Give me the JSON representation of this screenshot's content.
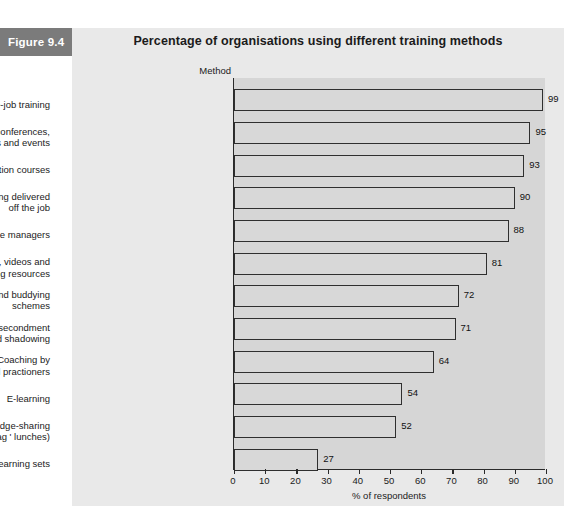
{
  "figure": {
    "label": "Figure 9.4"
  },
  "chart_data": {
    "type": "bar",
    "orientation": "horizontal",
    "title": "Percentage of organisations using different training methods",
    "xlabel": "% of respondents",
    "ylabel": "Method",
    "xlim": [
      0,
      100
    ],
    "xticks": [
      "0",
      "10",
      "20",
      "30",
      "40",
      "50",
      "60",
      "70",
      "80",
      "90",
      "100"
    ],
    "grid": false,
    "legend": null,
    "bar_fill_color": "#d8d8d8",
    "bar_edge_color": "#2f2f2f",
    "plot_bg_color": "#d6d6d6",
    "panel_bg_color": "#e9e9e9",
    "categories": [
      "On-the-job training",
      "External conferences,\nworkshops and events",
      "Formal education courses",
      "Instructor-led training delivered\noff the job",
      "Coaching by line managers",
      "Audio tapes, videos and\nlearning resources",
      "Mentoring and buddying\nschemes",
      "Job rotation, secondment\nand shadowing",
      "Coaching by\nexternal practioners",
      "E-learning",
      "Internal knowledge-sharing\nevents (brown bag ' lunches)",
      "Action learning sets"
    ],
    "values": [
      99,
      95,
      93,
      90,
      88,
      81,
      72,
      71,
      64,
      54,
      52,
      27
    ],
    "value_labels": [
      "99",
      "95",
      "93",
      "90",
      "88",
      "81",
      "72",
      "71",
      "64",
      "54",
      "52",
      "27"
    ]
  },
  "source": {
    "note": ""
  }
}
